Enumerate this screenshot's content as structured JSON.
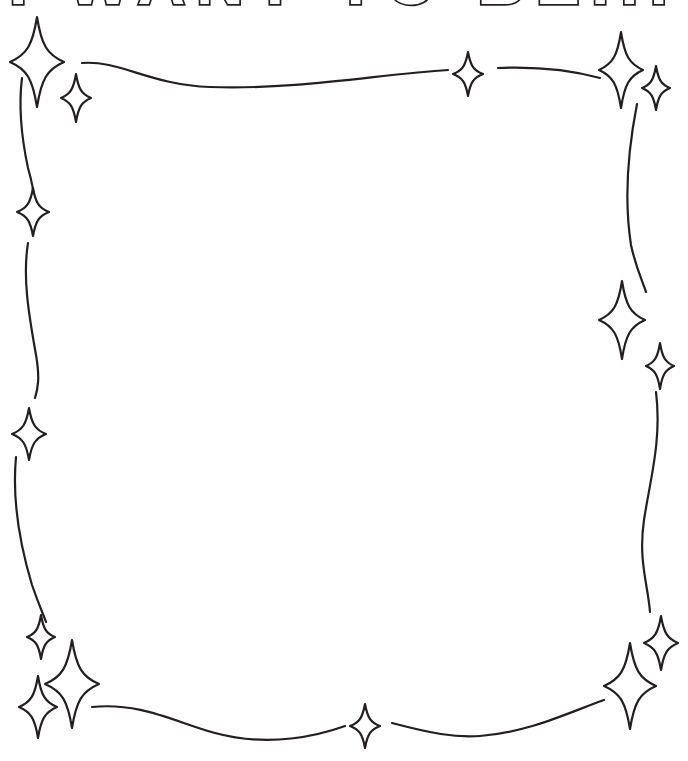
{
  "poster": {
    "title": "I WANT TO BE...",
    "background_color": "#ffffff",
    "ink_color": "#231f20",
    "width": 688,
    "height": 761
  },
  "title_block": {
    "text": "I WANT TO BE...",
    "style": "outlined-uppercase-bold",
    "clipped_at_top": true
  },
  "frame": {
    "name": "hand-drawn-wavy-border",
    "stroke_color": "#231f20",
    "stroke_width": 2.2,
    "fill": "none",
    "segments": [
      {
        "name": "border-top",
        "path": "M 82 63 C 120 60 150 85 210 87 C 300 90 380 74 448 70"
      },
      {
        "name": "border-top-right",
        "path": "M 498 68 C 545 66 578 72 600 78"
      },
      {
        "name": "border-right-upper",
        "path": "M 637 104 C 628 150 624 200 631 245 C 636 268 642 280 646 292"
      },
      {
        "name": "border-right-mid",
        "path": "M 656 392 C 662 440 650 480 644 520 C 638 560 648 585 650 612"
      },
      {
        "name": "border-bottom-left",
        "path": "M 92 707 C 140 702 175 722 215 733 C 270 748 320 735 345 726"
      },
      {
        "name": "border-bottom-right",
        "path": "M 392 723 C 430 733 455 738 480 736 C 530 732 570 712 604 700"
      },
      {
        "name": "border-left-upper",
        "path": "M 22 78 C 18 110 22 140 28 168 C 32 182 34 192 34 200"
      },
      {
        "name": "border-left-mid",
        "path": "M 28 243 C 22 280 30 320 36 355 C 40 378 38 388 35 398"
      },
      {
        "name": "border-left-lower",
        "path": "M 16 457 C 12 500 20 545 32 585 C 40 608 44 616 46 622"
      }
    ]
  },
  "sparkles": [
    {
      "name": "sparkle-top-left-large",
      "cx": 37,
      "cy": 62,
      "rx": 27,
      "ry": 45
    },
    {
      "name": "sparkle-top-left-small",
      "cx": 76,
      "cy": 98,
      "rx": 15,
      "ry": 24
    },
    {
      "name": "sparkle-top-center",
      "cx": 468,
      "cy": 74,
      "rx": 15,
      "ry": 22
    },
    {
      "name": "sparkle-top-right-large",
      "cx": 621,
      "cy": 70,
      "rx": 22,
      "ry": 38
    },
    {
      "name": "sparkle-top-right-small",
      "cx": 656,
      "cy": 88,
      "rx": 14,
      "ry": 22
    },
    {
      "name": "sparkle-left-upper",
      "cx": 33,
      "cy": 212,
      "rx": 16,
      "ry": 24
    },
    {
      "name": "sparkle-left-lower",
      "cx": 29,
      "cy": 434,
      "rx": 17,
      "ry": 26
    },
    {
      "name": "sparkle-right-large",
      "cx": 622,
      "cy": 320,
      "rx": 23,
      "ry": 39
    },
    {
      "name": "sparkle-right-small",
      "cx": 660,
      "cy": 366,
      "rx": 14,
      "ry": 23
    },
    {
      "name": "sparkle-bottom-left-small",
      "cx": 41,
      "cy": 637,
      "rx": 14,
      "ry": 22
    },
    {
      "name": "sparkle-bottom-left-large",
      "cx": 72,
      "cy": 684,
      "rx": 27,
      "ry": 44
    },
    {
      "name": "sparkle-bottom-left-medium",
      "cx": 38,
      "cy": 707,
      "rx": 19,
      "ry": 31
    },
    {
      "name": "sparkle-bottom-center",
      "cx": 365,
      "cy": 726,
      "rx": 15,
      "ry": 22
    },
    {
      "name": "sparkle-bottom-right-medium",
      "cx": 661,
      "cy": 643,
      "rx": 17,
      "ry": 27
    },
    {
      "name": "sparkle-bottom-right-large",
      "cx": 630,
      "cy": 686,
      "rx": 26,
      "ry": 43
    }
  ],
  "canvas": {
    "name": "empty-drawing-area",
    "content": ""
  }
}
